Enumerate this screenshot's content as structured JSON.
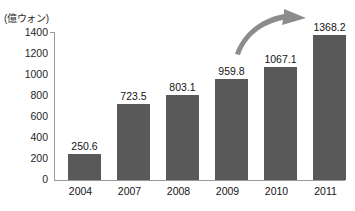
{
  "chart_data": {
    "type": "bar",
    "title": "",
    "subtitle": "",
    "xlabel": "",
    "ylabel": "(億ウォン)",
    "unit_label": "(億ウォン)",
    "categories": [
      "2004",
      "2007",
      "2008",
      "2009",
      "2010",
      "2011"
    ],
    "values": [
      250.6,
      723.5,
      803.1,
      959.8,
      1067.1,
      1368.2
    ],
    "value_labels": [
      "250.6",
      "723.5",
      "803.1",
      "959.8",
      "1067.1",
      "1368.2"
    ],
    "ylim": [
      0,
      1400
    ],
    "y_ticks": [
      0,
      200,
      400,
      600,
      800,
      1000,
      1200,
      1400
    ],
    "y_tick_labels": [
      "1400",
      "1200",
      "1000",
      "800",
      "600",
      "400",
      "200",
      "0"
    ],
    "grid": false,
    "legend": null,
    "legend_position": "none",
    "annotations": [
      {
        "name": "growth-arrow",
        "type": "curved-arrow",
        "description": "upward curved arrow from 2010 toward 2011",
        "color": "#8c8c8c"
      }
    ],
    "colors": {
      "bar": "#595959",
      "axis": "#9a9a9a",
      "text": "#141414",
      "arrow": "#8c8c8c",
      "background": "#ffffff"
    }
  }
}
